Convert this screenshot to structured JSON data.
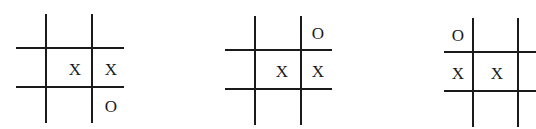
{
  "boards": [
    {
      "id": "board-1",
      "vlines": [
        {
          "x": 46,
          "top": 14,
          "bottom": 123
        },
        {
          "x": 92,
          "top": 14,
          "bottom": 123
        }
      ],
      "hlines": [
        {
          "y": 48,
          "left": 16,
          "right": 124
        },
        {
          "y": 87,
          "left": 16,
          "right": 124
        }
      ],
      "cells": [
        [
          "",
          "",
          ""
        ],
        [
          "",
          "X",
          "X"
        ],
        [
          "",
          "",
          "O"
        ]
      ],
      "marks": [
        {
          "symbol": "X",
          "row": 1,
          "col": 1,
          "x": 75,
          "y": 69
        },
        {
          "symbol": "X",
          "row": 1,
          "col": 2,
          "x": 111,
          "y": 69
        },
        {
          "symbol": "O",
          "row": 2,
          "col": 2,
          "x": 111,
          "y": 106
        }
      ]
    },
    {
      "id": "board-2",
      "vlines": [
        {
          "x": 255,
          "top": 16,
          "bottom": 125
        },
        {
          "x": 301,
          "top": 16,
          "bottom": 125
        }
      ],
      "hlines": [
        {
          "y": 50,
          "left": 225,
          "right": 332
        },
        {
          "y": 89,
          "left": 225,
          "right": 332
        }
      ],
      "cells": [
        [
          "",
          "",
          "O"
        ],
        [
          "",
          "X",
          "X"
        ],
        [
          "",
          "",
          ""
        ]
      ],
      "marks": [
        {
          "symbol": "O",
          "row": 0,
          "col": 2,
          "x": 318,
          "y": 33
        },
        {
          "symbol": "X",
          "row": 1,
          "col": 1,
          "x": 282,
          "y": 71
        },
        {
          "symbol": "X",
          "row": 1,
          "col": 2,
          "x": 318,
          "y": 71
        }
      ]
    },
    {
      "id": "board-3",
      "vlines": [
        {
          "x": 473,
          "top": 18,
          "bottom": 127
        },
        {
          "x": 518,
          "top": 18,
          "bottom": 127
        }
      ],
      "hlines": [
        {
          "y": 52,
          "left": 444,
          "right": 536
        },
        {
          "y": 91,
          "left": 444,
          "right": 536
        }
      ],
      "cells": [
        [
          "O",
          "",
          ""
        ],
        [
          "X",
          "X",
          ""
        ],
        [
          "",
          "",
          ""
        ]
      ],
      "marks": [
        {
          "symbol": "O",
          "row": 0,
          "col": 0,
          "x": 458,
          "y": 35
        },
        {
          "symbol": "X",
          "row": 1,
          "col": 0,
          "x": 458,
          "y": 73
        },
        {
          "symbol": "X",
          "row": 1,
          "col": 1,
          "x": 497,
          "y": 73
        }
      ]
    }
  ],
  "colors": {
    "line": "#1a1a1a",
    "mark": "#1a1a1a",
    "background": "#ffffff"
  }
}
